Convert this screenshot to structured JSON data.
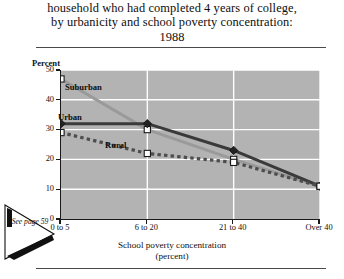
{
  "title": {
    "line1": "household who had completed 4 years of college,",
    "line2": "by  urbanicity and school poverty concentration:",
    "line3": "1988"
  },
  "annotation": {
    "see_label": "See",
    "page_label": "page 59"
  },
  "chart_data": {
    "type": "line",
    "title": "household who had completed 4 years of college, by  urbanicity and school poverty concentration: 1988",
    "categories": [
      "0 to 5",
      "6 to 20",
      "21 to 40",
      "Over 40"
    ],
    "series": [
      {
        "name": "Suburban",
        "values": [
          47,
          30,
          20,
          11
        ],
        "color": "#9a9a9a",
        "style": "solid",
        "marker": "open-square"
      },
      {
        "name": "Urban",
        "values": [
          32,
          32,
          23,
          11
        ],
        "color": "#3a3a3a",
        "style": "solid",
        "marker": "filled-diamond"
      },
      {
        "name": "Rural",
        "values": [
          29,
          22,
          19,
          11
        ],
        "color": "#4d4d4d",
        "style": "dashed",
        "marker": "open-square"
      }
    ],
    "xlabel": "School poverty concentration",
    "xlabel_sub": "(percent)",
    "ylabel": "Percent",
    "ylim": [
      0,
      50
    ],
    "yticks": [
      0,
      10,
      20,
      30,
      40,
      50
    ],
    "grid": true,
    "legend": "in-plot-labels",
    "plot_background": "#b3b3b3",
    "gridline_color": "#ffffff"
  }
}
